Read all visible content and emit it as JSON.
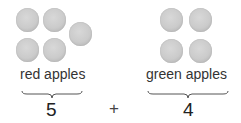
{
  "groups": [
    {
      "label": "red apples",
      "count": "5",
      "apple_count": 5
    },
    {
      "label": "green apples",
      "count": "4",
      "apple_count": 4
    }
  ],
  "operator": "+"
}
